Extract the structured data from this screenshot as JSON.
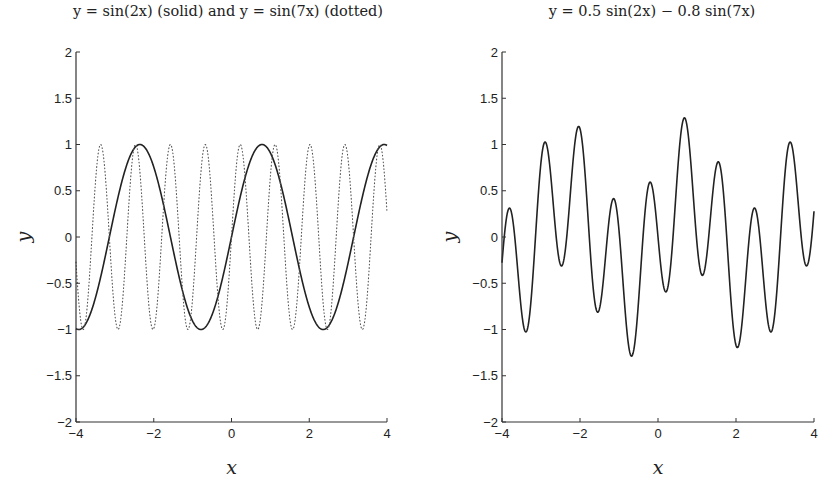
{
  "chart_data": [
    {
      "type": "line",
      "title": "y = sin(2x) (solid) and y = sin(7x) (dotted)",
      "xlabel": "x",
      "ylabel": "y",
      "xlim": [
        -4,
        4
      ],
      "ylim": [
        -2,
        2
      ],
      "xticks": [
        -4,
        -2,
        0,
        2,
        4
      ],
      "yticks": [
        -2,
        -1.5,
        -1,
        -0.5,
        0,
        0.5,
        1,
        1.5,
        2
      ],
      "xtick_labels": [
        "−4",
        "−2",
        "0",
        "2",
        "4"
      ],
      "ytick_labels": [
        "−2",
        "−1.5",
        "−1",
        "−0.5",
        "0",
        "0.5",
        "1",
        "1.5",
        "2"
      ],
      "grid": false,
      "series": [
        {
          "name": "sin(2x)",
          "style": "solid",
          "a": 1.0,
          "b": 0.0,
          "freq1": 2,
          "freq2": 7
        },
        {
          "name": "sin(7x)",
          "style": "dotted",
          "a": 0.0,
          "b": 1.0,
          "freq1": 2,
          "freq2": 7
        }
      ]
    },
    {
      "type": "line",
      "title": "y = 0.5 sin(2x) − 0.8 sin(7x)",
      "xlabel": "x",
      "ylabel": "y",
      "xlim": [
        -4,
        4
      ],
      "ylim": [
        -2,
        2
      ],
      "xticks": [
        -4,
        -2,
        0,
        2,
        4
      ],
      "yticks": [
        -2,
        -1.5,
        -1,
        -0.5,
        0,
        0.5,
        1,
        1.5,
        2
      ],
      "xtick_labels": [
        "−4",
        "−2",
        "0",
        "2",
        "4"
      ],
      "ytick_labels": [
        "−2",
        "−1.5",
        "−1",
        "−0.5",
        "0",
        "0.5",
        "1",
        "1.5",
        "2"
      ],
      "grid": false,
      "series": [
        {
          "name": "0.5 sin(2x) − 0.8 sin(7x)",
          "style": "solid",
          "a": 0.5,
          "b": -0.8,
          "freq1": 2,
          "freq2": 7
        }
      ]
    }
  ],
  "titles": {
    "left": "y = sin(2x) (solid) and y = sin(7x) (dotted)",
    "right": "y = 0.5 sin(2x) − 0.8 sin(7x)"
  },
  "layout": [
    {
      "x0": 76,
      "x1": 387,
      "y0": 52,
      "y1": 422,
      "title_x": 228,
      "title_y": 16
    },
    {
      "x0": 502,
      "x1": 814,
      "y0": 52,
      "y1": 422,
      "title_x": 652,
      "title_y": 16
    }
  ],
  "colors": {
    "line": "#222222",
    "axis": "#333333"
  }
}
